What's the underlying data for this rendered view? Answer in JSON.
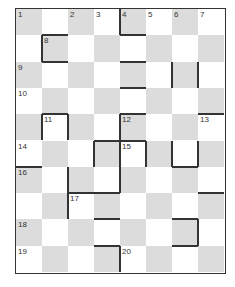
{
  "puzzle": {
    "type": "crossword-grid",
    "cols": 8,
    "rows": 10,
    "numbers": [
      {
        "n": "1",
        "r": 0,
        "c": 0
      },
      {
        "n": "2",
        "r": 0,
        "c": 2
      },
      {
        "n": "3",
        "r": 0,
        "c": 3
      },
      {
        "n": "4",
        "r": 0,
        "c": 4
      },
      {
        "n": "5",
        "r": 0,
        "c": 5
      },
      {
        "n": "6",
        "r": 0,
        "c": 6
      },
      {
        "n": "7",
        "r": 0,
        "c": 7
      },
      {
        "n": "8",
        "r": 1,
        "c": 1
      },
      {
        "n": "9",
        "r": 2,
        "c": 0
      },
      {
        "n": "10",
        "r": 3,
        "c": 0
      },
      {
        "n": "11",
        "r": 4,
        "c": 1
      },
      {
        "n": "12",
        "r": 4,
        "c": 4
      },
      {
        "n": "13",
        "r": 4,
        "c": 7
      },
      {
        "n": "14",
        "r": 5,
        "c": 0
      },
      {
        "n": "15",
        "r": 5,
        "c": 4
      },
      {
        "n": "16",
        "r": 6,
        "c": 0
      },
      {
        "n": "17",
        "r": 7,
        "c": 2
      },
      {
        "n": "18",
        "r": 8,
        "c": 0
      },
      {
        "n": "19",
        "r": 9,
        "c": 0
      },
      {
        "n": "20",
        "r": 9,
        "c": 4
      }
    ],
    "bars": [
      {
        "r": 0,
        "c": 4,
        "side": "left"
      },
      {
        "r": 0,
        "c": 4,
        "side": "bottom"
      },
      {
        "r": 1,
        "c": 1,
        "side": "top"
      },
      {
        "r": 1,
        "c": 1,
        "side": "left"
      },
      {
        "r": 1,
        "c": 1,
        "side": "bottom"
      },
      {
        "r": 2,
        "c": 4,
        "side": "top"
      },
      {
        "r": 2,
        "c": 4,
        "side": "bottom"
      },
      {
        "r": 2,
        "c": 6,
        "side": "left"
      },
      {
        "r": 2,
        "c": 6,
        "side": "right"
      },
      {
        "r": 4,
        "c": 1,
        "side": "top"
      },
      {
        "r": 4,
        "c": 1,
        "side": "left"
      },
      {
        "r": 4,
        "c": 1,
        "side": "right"
      },
      {
        "r": 4,
        "c": 3,
        "side": "bottom"
      },
      {
        "r": 4,
        "c": 4,
        "side": "top"
      },
      {
        "r": 4,
        "c": 4,
        "side": "left"
      },
      {
        "r": 4,
        "c": 7,
        "side": "top"
      },
      {
        "r": 5,
        "c": 4,
        "side": "top"
      },
      {
        "r": 5,
        "c": 4,
        "side": "left"
      },
      {
        "r": 5,
        "c": 4,
        "side": "right"
      },
      {
        "r": 5,
        "c": 6,
        "side": "left"
      },
      {
        "r": 5,
        "c": 6,
        "side": "right"
      },
      {
        "r": 5,
        "c": 6,
        "side": "bottom"
      },
      {
        "r": 5,
        "c": 3,
        "side": "left"
      },
      {
        "r": 6,
        "c": 0,
        "side": "top"
      },
      {
        "r": 6,
        "c": 1,
        "side": "right"
      },
      {
        "r": 6,
        "c": 3,
        "side": "right"
      },
      {
        "r": 6,
        "c": 2,
        "side": "bottom"
      },
      {
        "r": 7,
        "c": 1,
        "side": "right"
      },
      {
        "r": 7,
        "c": 3,
        "side": "top"
      },
      {
        "r": 7,
        "c": 3,
        "side": "bottom"
      },
      {
        "r": 7,
        "c": 7,
        "side": "top"
      },
      {
        "r": 8,
        "c": 6,
        "side": "top"
      },
      {
        "r": 8,
        "c": 6,
        "side": "right"
      },
      {
        "r": 8,
        "c": 6,
        "side": "bottom"
      },
      {
        "r": 8,
        "c": 3,
        "side": "bottom"
      },
      {
        "r": 9,
        "c": 3,
        "side": "right"
      }
    ],
    "colors": {
      "shade": "#dcdcdc",
      "line": "#333333"
    }
  }
}
